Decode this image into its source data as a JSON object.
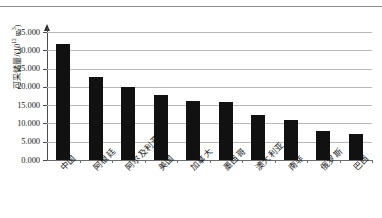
{
  "figure": {
    "has_top_rule": true,
    "background_color": "#ffffff",
    "bar_color": "#111111",
    "gridline_color": "#b9b9b9",
    "axis_color": "#4a4a4a"
  },
  "chart_data": {
    "type": "bar",
    "title": "",
    "xlabel": "",
    "ylabel": "可采储量/(10¹² m³)",
    "ylabel_parts": {
      "name": "可采储量/(10",
      "exponent": "12",
      "unit": " m",
      "unit_exponent": "3",
      "close": ")"
    },
    "categories": [
      "中国",
      "阿根廷",
      "阿尔及利亚",
      "美国",
      "加拿大",
      "墨西哥",
      "澳大利亚",
      "南非",
      "俄罗斯",
      "巴西"
    ],
    "values": [
      31.6,
      22.7,
      20.0,
      17.7,
      16.2,
      15.8,
      12.4,
      11.0,
      8.0,
      7.0
    ],
    "ylim": [
      0,
      35
    ],
    "ytick_values": [
      0,
      5,
      10,
      15,
      20,
      25,
      30,
      35
    ],
    "ytick_labels": [
      "0.000",
      "5.000",
      "10.000",
      "15.000",
      "20.000",
      "25.000",
      "30.000",
      "35.000"
    ],
    "grid": true,
    "grid_axis": "y",
    "legend": null,
    "legend_position": "none",
    "series": [
      {
        "name": "可采储量",
        "values": [
          31.6,
          22.7,
          20.0,
          17.7,
          16.2,
          15.8,
          12.4,
          11.0,
          8.0,
          7.0
        ]
      }
    ]
  }
}
